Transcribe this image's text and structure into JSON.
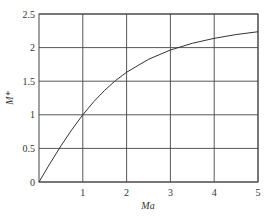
{
  "chart_data": {
    "type": "line",
    "title": "",
    "xlabel": "Ma",
    "ylabel": "M*",
    "xlim": [
      0,
      5
    ],
    "ylim": [
      0,
      2.5
    ],
    "grid": true,
    "legend": null,
    "x_ticks": [
      "1",
      "2",
      "3",
      "4",
      "5"
    ],
    "y_ticks": [
      "0",
      "0.5",
      "1",
      "1.5",
      "2",
      "2.5"
    ],
    "series": [
      {
        "name": "M*",
        "x": [
          0,
          0.25,
          0.5,
          0.75,
          1,
          1.25,
          1.5,
          1.75,
          2,
          2.5,
          3,
          3.5,
          4,
          4.5,
          5
        ],
        "values": [
          0,
          0.274,
          0.536,
          0.779,
          1.0,
          1.195,
          1.365,
          1.511,
          1.633,
          1.826,
          1.964,
          2.064,
          2.138,
          2.194,
          2.236
        ]
      }
    ],
    "colors": {
      "line": "#333333",
      "grid": "#444444",
      "frame": "#444444"
    }
  }
}
